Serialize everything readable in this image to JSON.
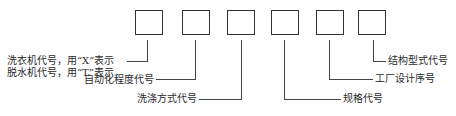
{
  "diagram": {
    "type": "code-structure",
    "box_count": 6,
    "colors": {
      "line": "#444444",
      "box_border": "#333333",
      "text": "#2a2a2a",
      "background": "#ffffff"
    },
    "labels": {
      "box1_line1": "洗衣机代号，用“X”表示",
      "box1_line2": "脱水机代号，用“T”表示",
      "box2": "自动化程度代号",
      "box3": "洗涤方式代号",
      "box4": "规格代号",
      "box5": "工厂设计序号",
      "box6": "结构型式代号"
    }
  }
}
